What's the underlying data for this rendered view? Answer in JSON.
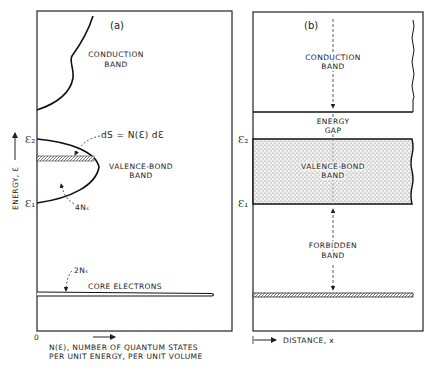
{
  "panel_a": {
    "tag": "(a)",
    "conduction_band": [
      "CONDUCTION",
      "BAND"
    ],
    "valence_band": [
      "VALENCE-BOND",
      "BAND"
    ],
    "ds_label": "dS = N(Ɛ) dƐ",
    "four_ns": "4Nₛ",
    "two_ns": "2Nₛ",
    "core_electrons": "CORE ELECTRONS",
    "e2": "Ɛ₂",
    "e1": "Ɛ₁",
    "y_axis_label": "ENERGY, Ɛ",
    "origin": "0",
    "x_axis_label": [
      "N(Ɛ), NUMBER OF QUANTUM STATES",
      "PER UNIT ENERGY, PER UNIT VOLUME"
    ]
  },
  "panel_b": {
    "tag": "(b)",
    "conduction_band": [
      "CONDUCTION",
      "BAND"
    ],
    "energy_gap": [
      "ENERGY",
      "GAP"
    ],
    "valence_band": [
      "VALENCE-BOND",
      "BAND"
    ],
    "forbidden_band": [
      "FORBIDDEN",
      "BAND"
    ],
    "e2": "Ɛ₂",
    "e1": "Ɛ₁",
    "x_axis_label": "DISTANCE, x"
  }
}
